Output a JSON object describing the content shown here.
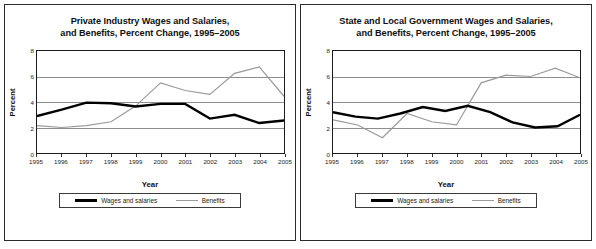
{
  "figure": {
    "panels": [
      {
        "id": "private-industry",
        "title_line1": "Private Industry Wages and Salaries,",
        "title_line2": "and Benefits, Percent Change, 1995–2005",
        "xlabel": "Year",
        "ylabel": "Percent",
        "legend": {
          "series1": "Wages and salaries",
          "series2": "Benefits"
        }
      },
      {
        "id": "state-local-government",
        "title_line1": "State and Local Government Wages and Salaries,",
        "title_line2": "and Benefits, Percent Change, 1995–2005",
        "xlabel": "Year",
        "ylabel": "Percent",
        "legend": {
          "series1": "Wages and salaries",
          "series2": "Benefits"
        }
      }
    ],
    "colors": {
      "wages": "#000000",
      "benefits": "#9a9a9a",
      "grid": "#8e8e8e",
      "axis": "#1c1c1c",
      "border": "#2b2b2b"
    }
  },
  "chart_data": [
    {
      "type": "line",
      "title": "Private Industry Wages and Salaries, and Benefits, Percent Change, 1995–2005",
      "xlabel": "Year",
      "ylabel": "Percent",
      "x": [
        1995,
        1996,
        1997,
        1998,
        1999,
        2000,
        2001,
        2002,
        2003,
        2004,
        2005
      ],
      "xticklabels": [
        "1995",
        "1996",
        "1997",
        "1998",
        "1999",
        "2000",
        "2001",
        "2002",
        "2003",
        "2004",
        "2005"
      ],
      "yticks": [
        0,
        2,
        4,
        6,
        8
      ],
      "yticklabels": [
        "0",
        "2",
        "4",
        "6",
        "8"
      ],
      "ylim": [
        0,
        8
      ],
      "xlim": [
        1995,
        2005
      ],
      "grid": true,
      "legend_position": "bottom",
      "series": [
        {
          "name": "Wages and salaries",
          "color": "#000000",
          "values": [
            2.9,
            3.4,
            3.95,
            3.9,
            3.65,
            3.85,
            3.85,
            2.7,
            3.0,
            2.35,
            2.55
          ]
        },
        {
          "name": "Benefits",
          "color": "#9a9a9a",
          "values": [
            2.15,
            2.0,
            2.15,
            2.45,
            3.7,
            5.5,
            4.9,
            4.6,
            6.25,
            6.75,
            4.45
          ]
        }
      ]
    },
    {
      "type": "line",
      "title": "State and Local Government Wages and Salaries, and Benefits, Percent Change, 1995–2005",
      "xlabel": "Year",
      "ylabel": "Percent",
      "x": [
        1995,
        1996,
        1997,
        1998,
        1999,
        2000,
        2001,
        2002,
        2003,
        2004,
        2005
      ],
      "xticklabels": [
        "1995",
        "1996",
        "1997",
        "1998",
        "1999",
        "2000",
        "2001",
        "2002",
        "2003",
        "2004",
        "2005"
      ],
      "yticks": [
        0,
        2,
        4,
        6,
        8
      ],
      "yticklabels": [
        "0",
        "2",
        "4",
        "6",
        "8"
      ],
      "ylim": [
        0,
        8
      ],
      "xlim": [
        1995,
        2005
      ],
      "grid": true,
      "legend_position": "bottom",
      "series": [
        {
          "name": "Wages and salaries",
          "color": "#000000",
          "values": [
            3.2,
            2.85,
            2.7,
            3.1,
            3.6,
            3.3,
            3.7,
            3.2,
            2.4,
            2.0,
            2.1,
            3.0
          ]
        },
        {
          "name": "Benefits",
          "color": "#9a9a9a",
          "values": [
            2.6,
            2.2,
            1.2,
            3.1,
            2.45,
            2.2,
            5.5,
            6.1,
            6.0,
            6.65,
            5.9
          ]
        }
      ]
    }
  ]
}
